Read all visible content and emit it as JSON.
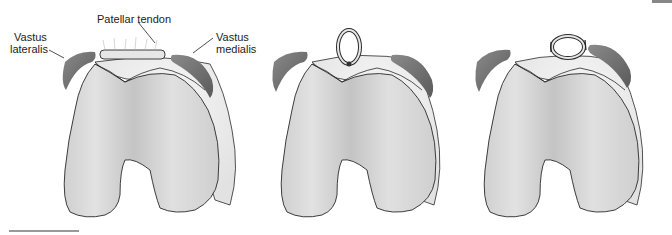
{
  "figure": {
    "panels": [
      {
        "id": "panel-1",
        "description": "Patellar tendon rupture site with quadriceps muscles",
        "labels": {
          "patellar_tendon": "Patellar tendon",
          "vastus_lateralis_1": "Vastus",
          "vastus_lateralis_2": "lateralis",
          "vastus_medialis_1": "Vastus",
          "vastus_medialis_2": "medialis"
        }
      },
      {
        "id": "panel-2",
        "description": "Tendon looped and sutured (vertical loop)"
      },
      {
        "id": "panel-3",
        "description": "Tendon loop tied transversely with sutures"
      }
    ],
    "colors": {
      "bone_fill": "#d9d9d9",
      "bone_shade": "#bdbdbd",
      "outline": "#2a2a2a",
      "muscle": "#6e6e6e",
      "soft_tissue": "#ececec",
      "background": "#ffffff"
    }
  }
}
